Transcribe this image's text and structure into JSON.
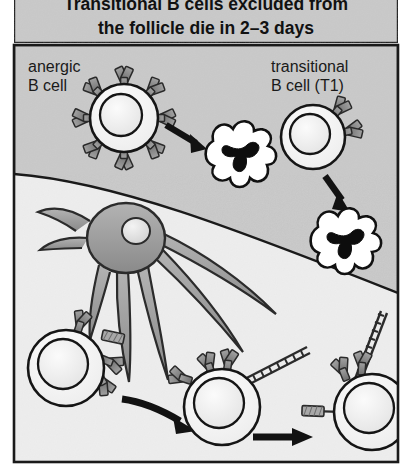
{
  "figure": {
    "title_line1": "Transitional B cells excluded from",
    "title_line2": "the follicle die in 2–3 days",
    "labels": {
      "anergic_line1": "anergic",
      "anergic_line2": "B cell",
      "transitional_line1": "transitional",
      "transitional_line2": "B cell (T1)"
    },
    "colors": {
      "panel_gray": "#c9c9c9",
      "follicle_light": "#ececec",
      "border": "#1a1a1a",
      "cell_fill": "#f2f2f2",
      "nucleus_fill": "#e8e8e8",
      "receptor_fill": "#8a8a8a",
      "dendritic_fill": "#9a9a9a",
      "apoptotic_fill": "#ffffff",
      "apoptotic_nucleus": "#0d0d0d",
      "arrow": "#121212",
      "title_text": "#111111",
      "label_text": "#1a1a1a"
    },
    "regions": {
      "upper_zone_name": "extrafollicular zone",
      "lower_zone_name": "follicle"
    },
    "elements": {
      "anergic_b_cell_receptor_count": 8,
      "transitional_b_cell_receptor_count": 2,
      "apoptotic_cell_count": 2,
      "dendritic_cell_count": 1,
      "dendritic_process_count": 7,
      "bottom_b_cell_count": 3,
      "arrow_count": 4
    }
  }
}
